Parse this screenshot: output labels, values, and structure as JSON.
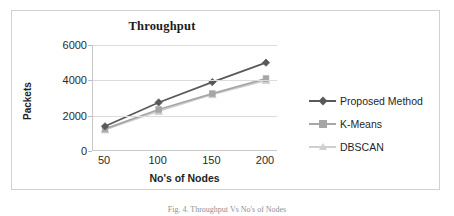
{
  "figure": {
    "caption": "Fig. 4. Throughput Vs No's of Nodes",
    "border_color": "#d2d2d2",
    "background": "#ffffff"
  },
  "chart_data": {
    "type": "line",
    "title": "Throughput",
    "xlabel": "No's of Nodes",
    "ylabel": "Packets",
    "categories": [
      "50",
      "100",
      "150",
      "200"
    ],
    "x": [
      50,
      100,
      150,
      200
    ],
    "ylim": [
      0,
      6000
    ],
    "yticks": [
      "0",
      "2000",
      "4000",
      "6000"
    ],
    "ytick_values": [
      0,
      2000,
      4000,
      6000
    ],
    "grid": true,
    "legend_position": "right",
    "series": [
      {
        "name": "Proposed Method",
        "values": [
          1400,
          2750,
          3900,
          5000
        ],
        "color": "#595959",
        "marker": "diamond"
      },
      {
        "name": "K-Means",
        "values": [
          1250,
          2350,
          3250,
          4100
        ],
        "color": "#a6a6a6",
        "marker": "square"
      },
      {
        "name": "DBSCAN",
        "values": [
          1200,
          2250,
          3200,
          4000
        ],
        "color": "#cfcfcf",
        "marker": "triangle"
      }
    ]
  }
}
